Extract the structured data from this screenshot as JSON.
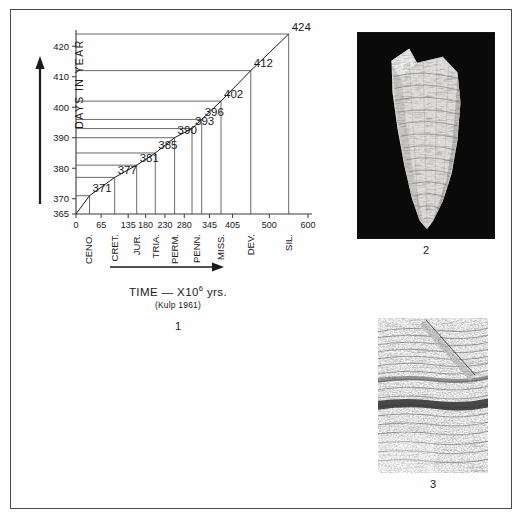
{
  "plate": {
    "figures": [
      {
        "number": "1",
        "kind": "chart"
      },
      {
        "number": "2",
        "kind": "photograph"
      },
      {
        "number": "3",
        "kind": "photograph"
      }
    ]
  },
  "chart_data": {
    "type": "line",
    "title": "",
    "xlabel": "TIME — X10",
    "xlabel_exponent": "6",
    "xlabel_unit": "yrs.",
    "xlabel_source": "(Kulp 1961)",
    "ylabel": "DAYS  IN  YEAR",
    "xlim": [
      0,
      600
    ],
    "ylim": [
      365,
      424
    ],
    "grid": false,
    "legend": "none",
    "x_ticks": [
      0,
      65,
      135,
      180,
      230,
      280,
      345,
      405,
      500,
      600
    ],
    "x_tick_labels": [
      "0",
      "65",
      "135",
      "180",
      "230",
      "280",
      "345",
      "405",
      "500",
      "600"
    ],
    "y_ticks": [
      365,
      370,
      380,
      390,
      400,
      410,
      420
    ],
    "y_tick_labels": [
      "365",
      "370",
      "380",
      "390",
      "400",
      "410",
      "420"
    ],
    "period_labels": [
      "CENO.",
      "CRET.",
      "JUR.",
      "TRIA.",
      "PERM.",
      "PENN.",
      "MISS.",
      "DEV.",
      "SIL.",
      "ORD.",
      "CAM."
    ],
    "x": [
      0,
      35,
      100,
      157,
      205,
      255,
      300,
      325,
      375,
      452,
      550
    ],
    "y": [
      365,
      371,
      377,
      381,
      385,
      390,
      393,
      396,
      402,
      412,
      424
    ],
    "point_labels": [
      "",
      "371",
      "377",
      "381",
      "385",
      "390",
      "393",
      "396",
      "402",
      "412",
      "424"
    ],
    "origin_label": "0"
  },
  "figure2": {
    "number": "2",
    "subject": "fossil coral specimen on black background"
  },
  "figure3": {
    "number": "3",
    "subject": "close-up of growth bands"
  },
  "colors": {
    "ink": "#1a1a1a",
    "line": "#3a3a3a",
    "border": "#4a4a4a",
    "photo_background": "#0a0a0a",
    "paper": "#fefefe"
  }
}
